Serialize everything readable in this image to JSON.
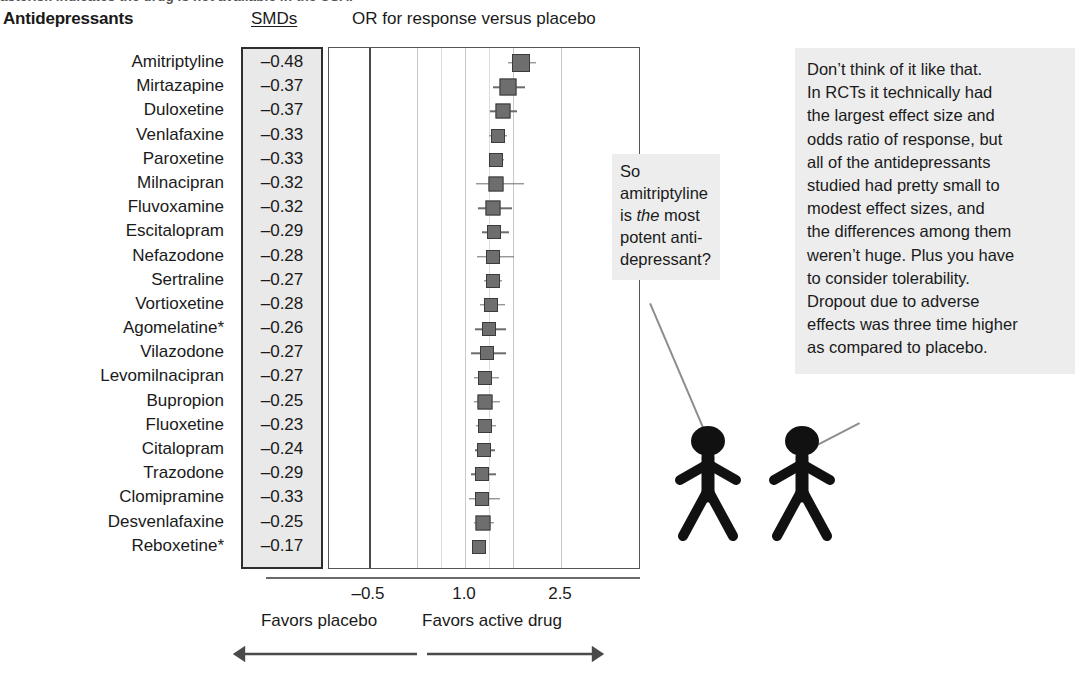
{
  "caption": {
    "cutoff_text": "asterisk indicates the drug is not available in the USA."
  },
  "header": {
    "title": "Antidepressants",
    "smd_column": "SMDs",
    "plot_title": "OR for response versus placebo"
  },
  "chart_data": {
    "type": "bar",
    "title": "OR for response versus placebo",
    "xlabel": "",
    "ylabel": "",
    "xlim": [
      -0.5,
      2.5
    ],
    "xticks": [
      "-0.5",
      "1.0",
      "2.5"
    ],
    "xtick_values": [
      -0.5,
      1.0,
      2.5
    ],
    "grid": true,
    "legend": "none",
    "favors_left": "Favors placebo",
    "favors_right": "Favors active drug",
    "categories": [
      "Amitriptyline",
      "Mirtazapine",
      "Duloxetine",
      "Venlafaxine",
      "Paroxetine",
      "Milnacipran",
      "Fluvoxamine",
      "Escitalopram",
      "Nefazodone",
      "Sertraline",
      "Vortioxetine",
      "Agomelatine*",
      "Vilazodone",
      "Levomilnacipran",
      "Bupropion",
      "Fluoxetine",
      "Citalopram",
      "Trazodone",
      "Clomipramine",
      "Desvenlafaxine",
      "Reboxetine*"
    ],
    "smd_values": [
      "–0.48",
      "–0.37",
      "–0.37",
      "–0.33",
      "–0.33",
      "–0.32",
      "–0.32",
      "–0.29",
      "–0.28",
      "–0.27",
      "–0.28",
      "–0.26",
      "–0.27",
      "–0.27",
      "–0.25",
      "–0.23",
      "–0.24",
      "–0.29",
      "–0.33",
      "–0.25",
      "–0.17"
    ],
    "odds_ratios": [
      1.88,
      1.67,
      1.59,
      1.51,
      1.49,
      1.49,
      1.44,
      1.45,
      1.44,
      1.43,
      1.41,
      1.37,
      1.34,
      1.32,
      1.32,
      1.31,
      1.29,
      1.27,
      1.27,
      1.28,
      1.22
    ],
    "ci_low": [
      1.67,
      1.44,
      1.39,
      1.38,
      1.38,
      1.17,
      1.21,
      1.26,
      1.18,
      1.3,
      1.24,
      1.16,
      1.09,
      1.14,
      1.14,
      1.17,
      1.15,
      1.1,
      1.07,
      1.14,
      1.13
    ],
    "ci_high": [
      2.11,
      1.93,
      1.81,
      1.65,
      1.61,
      1.92,
      1.73,
      1.68,
      1.77,
      1.58,
      1.62,
      1.64,
      1.64,
      1.53,
      1.54,
      1.48,
      1.47,
      1.48,
      1.54,
      1.46,
      1.33
    ],
    "marker_sizes": [
      18,
      17,
      15,
      14,
      14,
      15,
      15,
      14,
      14,
      14,
      14,
      14,
      14,
      14,
      15,
      14,
      14,
      14,
      14,
      15,
      14
    ]
  },
  "bubble_left": {
    "lines": [
      {
        "text": "So"
      },
      {
        "text": "amitriptyline"
      },
      {
        "pre": "is ",
        "em": "the",
        "post": " most"
      },
      {
        "text": "potent anti-"
      },
      {
        "text": "depressant?"
      }
    ]
  },
  "bubble_right": {
    "lines": [
      "Don’t think of it like that.",
      "In RCTs it technically had",
      "the largest effect size and",
      "odds ratio of response, but",
      "all of the antidepressants",
      "studied had pretty small to",
      "modest effect sizes, and",
      "the differences among them",
      "weren’t huge. Plus you have",
      "to consider tolerability.",
      "Dropout due to adverse",
      "effects was three time higher",
      "as compared to placebo."
    ]
  },
  "figures": {
    "left_name": "stick-figure-asking",
    "right_name": "stick-figure-answering"
  },
  "colors": {
    "marker_fill": "#6e6e6e",
    "marker_border": "#3b3b3b",
    "smd_box_bg": "#e9e9e9",
    "bubble_bg": "#ededed",
    "gridline": "#c9c9c9",
    "gridline_major": "#4a4a4a",
    "figure_fill": "#111111"
  }
}
